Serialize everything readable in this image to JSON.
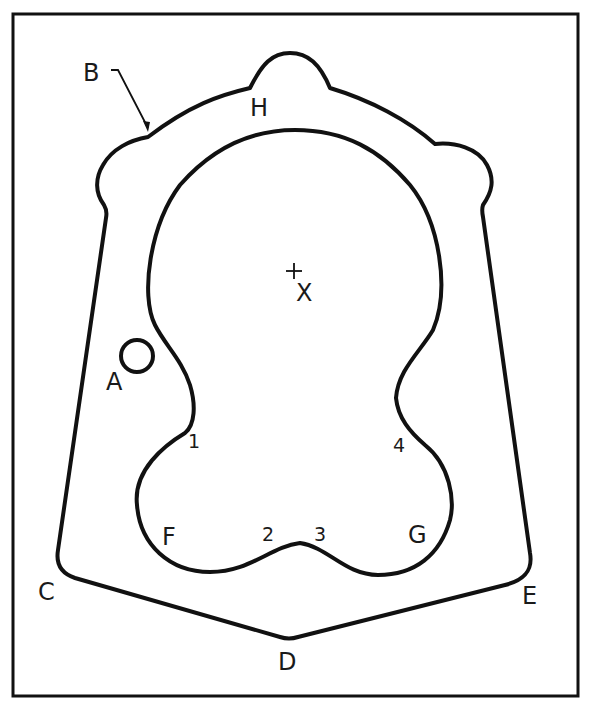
{
  "diagram": {
    "type": "technical-drawing",
    "colors": {
      "line": "#111111",
      "background": "#ffffff"
    },
    "labels": {
      "A": "A",
      "B": "B",
      "C": "C",
      "D": "D",
      "E": "E",
      "F": "F",
      "G": "G",
      "H": "H",
      "X": "X",
      "p1": "1",
      "p2": "2",
      "p3": "3",
      "p4": "4"
    },
    "center_mark": "+"
  }
}
